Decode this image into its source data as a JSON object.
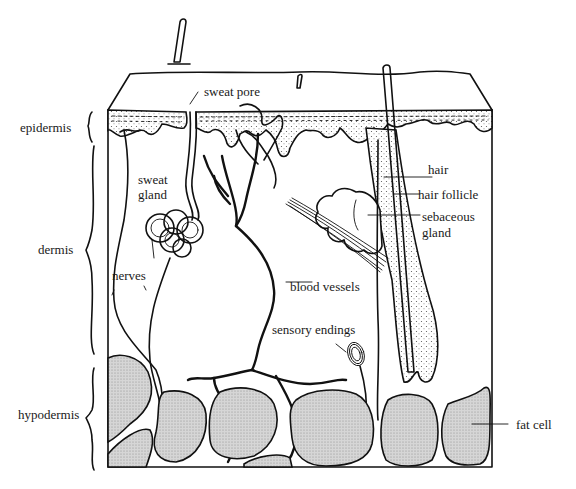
{
  "diagram": {
    "layers": [
      {
        "id": "epidermis",
        "label": "epidermis"
      },
      {
        "id": "dermis",
        "label": "dermis"
      },
      {
        "id": "hypodermis",
        "label": "hypodermis"
      }
    ],
    "structures": {
      "sweat_pore": "sweat pore",
      "sweat_gland_line1": "sweat",
      "sweat_gland_line2": "gland",
      "nerves": "nerves",
      "blood_vessels": "blood vessels",
      "hair": "hair",
      "hair_follicle": "hair follicle",
      "sebaceous_gland_line1": "sebaceous",
      "sebaceous_gland_line2": "gland",
      "sensory_endings": "sensory endings",
      "fat_cell": "fat cell"
    },
    "colors": {
      "ink": "#111111",
      "epidermis_fill": "#ebebeb",
      "fat_fill": "#cfcfcf",
      "background": "#ffffff"
    }
  }
}
